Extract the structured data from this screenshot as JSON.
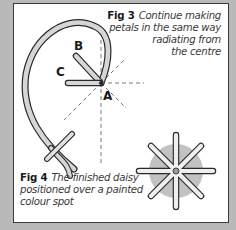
{
  "figures": {
    "fig3": {
      "number": "Fig 3",
      "caption_lines": [
        "Continue making",
        "petals in the same way",
        "radiating from",
        "the centre"
      ],
      "labels": {
        "a": "A",
        "b": "B",
        "c": "C"
      }
    },
    "fig4": {
      "number": "Fig 4",
      "caption_lines": [
        "The finished daisy",
        "positioned over a painted",
        "colour spot"
      ]
    }
  },
  "colors": {
    "background": "#b9b9b9",
    "panel": "#ffffff",
    "petal_fill": "#d4d4d4",
    "outline": "#2a2a2a",
    "colour_spot": "#c2c2c2"
  }
}
